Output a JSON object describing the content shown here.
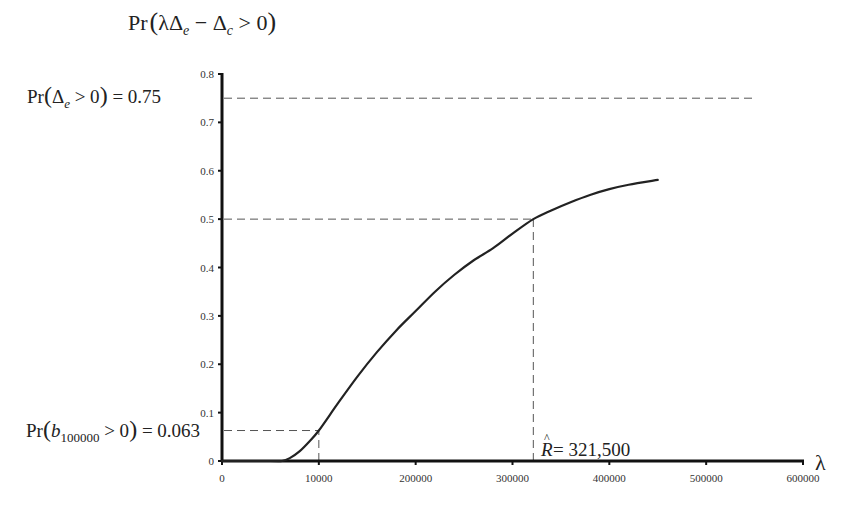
{
  "chart_data": {
    "type": "line",
    "title": "",
    "ylabel": "Pr(λΔe − Δc > 0)",
    "xlabel": "λ",
    "xlim": [
      0,
      600000
    ],
    "ylim": [
      0,
      0.8
    ],
    "grid": false,
    "legend": null,
    "x_ticks": [
      {
        "value": 0,
        "label": "0"
      },
      {
        "value": 100000,
        "label": "10000"
      },
      {
        "value": 200000,
        "label": "200000"
      },
      {
        "value": 300000,
        "label": "300000"
      },
      {
        "value": 400000,
        "label": "400000"
      },
      {
        "value": 500000,
        "label": "500000"
      },
      {
        "value": 600000,
        "label": "600000"
      }
    ],
    "y_ticks": [
      {
        "value": 0,
        "label": "0"
      },
      {
        "value": 0.1,
        "label": "0.1"
      },
      {
        "value": 0.2,
        "label": "0.2"
      },
      {
        "value": 0.3,
        "label": "0.3"
      },
      {
        "value": 0.4,
        "label": "0.4"
      },
      {
        "value": 0.5,
        "label": "0.5"
      },
      {
        "value": 0.6,
        "label": "0.6"
      },
      {
        "value": 0.7,
        "label": "0.7"
      },
      {
        "value": 0.8,
        "label": "0.8"
      }
    ],
    "series": [
      {
        "name": "Pr(λΔe − Δc > 0)",
        "x": [
          0,
          50000,
          62000,
          70000,
          80000,
          90000,
          100000,
          120000,
          140000,
          160000,
          180000,
          200000,
          220000,
          240000,
          260000,
          280000,
          300000,
          321500,
          340000,
          360000,
          380000,
          400000,
          420000,
          450000
        ],
        "y": [
          0,
          0,
          0.0,
          0.006,
          0.02,
          0.04,
          0.063,
          0.12,
          0.175,
          0.225,
          0.27,
          0.31,
          0.35,
          0.385,
          0.415,
          0.44,
          0.47,
          0.5,
          0.518,
          0.535,
          0.55,
          0.562,
          0.571,
          0.581
        ]
      }
    ],
    "reference_lines": [
      {
        "orientation": "horizontal",
        "y": 0.75,
        "x_from": 0,
        "x_to": 550000,
        "style": "dashed"
      },
      {
        "orientation": "horizontal",
        "y": 0.5,
        "x_from": 0,
        "x_to": 321500,
        "style": "dashed"
      },
      {
        "orientation": "vertical",
        "x": 321500,
        "y_from": 0,
        "y_to": 0.5,
        "style": "dashed"
      },
      {
        "orientation": "horizontal",
        "y": 0.063,
        "x_from": 0,
        "x_to": 100000,
        "style": "dashed"
      },
      {
        "orientation": "vertical",
        "x": 100000,
        "y_from": 0,
        "y_to": 0.063,
        "style": "dashed"
      }
    ],
    "annotations": [
      {
        "text": "Pr(Δe > 0) = 0.75",
        "x": 0,
        "y": 0.75
      },
      {
        "text": "Pr(b100000 > 0) = 0.063",
        "x": 0,
        "y": 0.063
      },
      {
        "text": "R̂ = 321,500",
        "x": 321500,
        "y": 0
      }
    ]
  },
  "labels": {
    "ylabel_pr": "Pr",
    "ylabel_lambda_delta": "λΔ",
    "ylabel_e": "e",
    "ylabel_minus_delta": " − Δ",
    "ylabel_c": "c",
    "ylabel_gt0": " > 0",
    "xlabel": "λ",
    "ann1_pr": "Pr",
    "ann1_delta": "Δ",
    "ann1_sub": "e",
    "ann1_rest": " > 0",
    "ann1_value": " = 0.75",
    "ann2_pr": "Pr",
    "ann2_b": "b",
    "ann2_sub": "100000",
    "ann2_rest": " > 0",
    "ann2_value": " = 0.063",
    "ann3_R": "R",
    "ann3_hat": "^",
    "ann3_value": " = 321,500"
  }
}
